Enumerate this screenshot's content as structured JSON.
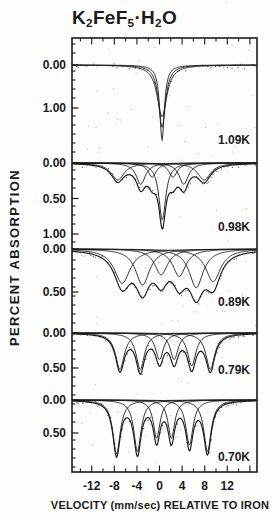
{
  "title": {
    "parts": [
      "K",
      "2",
      "FeF",
      "5",
      "·H",
      "2",
      "O"
    ]
  },
  "x_axis": {
    "label": "VELOCITY (mm/sec) RELATIVE TO IRON"
  },
  "y_axis": {
    "label": "PERCENT ABSORPTION"
  },
  "chart_data": {
    "type": "line",
    "x_unit": "mm/sec",
    "y_unit": "percent absorption",
    "x_major_ticks": [
      -12,
      -8,
      -4,
      0,
      4,
      8,
      12
    ],
    "x_major_tick_labels": [
      "-12",
      "-8",
      "-4",
      "0",
      "4",
      "8",
      "12"
    ],
    "x_minor_tick_step": 2,
    "panels": [
      {
        "temperature": "1.09K",
        "y_ticks": [
          {
            "label": "0.00",
            "value": 0.0
          },
          {
            "label": "1.00",
            "value": 1.0
          }
        ],
        "draw_sum": false,
        "components": [
          {
            "center": 0.45,
            "depth": 1.74,
            "width": 0.5
          },
          {
            "center": 0.45,
            "depth": 1.45,
            "width": 0.75
          },
          {
            "center": 0.45,
            "depth": 1.2,
            "width": 1.05
          }
        ],
        "baseline_px": 65,
        "px_per_percent": 43,
        "label_y_px": 140
      },
      {
        "temperature": "0.98K",
        "y_ticks": [
          {
            "label": "0.00",
            "value": 0.0
          },
          {
            "label": "0.50",
            "value": 0.5
          },
          {
            "label": "1.00",
            "value": 1.0
          }
        ],
        "draw_sum": true,
        "components": [
          {
            "center": -7.4,
            "depth": 0.24,
            "width": 1.4
          },
          {
            "center": -3.3,
            "depth": 0.3,
            "width": 1.0
          },
          {
            "center": -1.3,
            "depth": 0.2,
            "width": 0.9
          },
          {
            "center": 0.5,
            "depth": 0.8,
            "width": 0.75
          },
          {
            "center": 2.4,
            "depth": 0.2,
            "width": 0.9
          },
          {
            "center": 4.3,
            "depth": 0.3,
            "width": 1.0
          },
          {
            "center": 7.9,
            "depth": 0.24,
            "width": 1.4
          }
        ],
        "baseline_px": 163,
        "px_per_percent": 71,
        "label_y_px": 227
      },
      {
        "temperature": "0.89K",
        "y_ticks": [
          {
            "label": "0.00",
            "value": 0.0
          },
          {
            "label": "0.50",
            "value": 0.5
          }
        ],
        "draw_sum": true,
        "components": [
          {
            "center": -6.6,
            "depth": 0.4,
            "width": 1.7
          },
          {
            "center": -3.0,
            "depth": 0.42,
            "width": 1.5
          },
          {
            "center": 0.3,
            "depth": 0.3,
            "width": 1.4
          },
          {
            "center": 3.5,
            "depth": 0.32,
            "width": 1.4
          },
          {
            "center": 6.5,
            "depth": 0.45,
            "width": 1.5
          },
          {
            "center": 9.5,
            "depth": 0.38,
            "width": 1.6
          }
        ],
        "baseline_px": 249,
        "px_per_percent": 86,
        "label_y_px": 302
      },
      {
        "temperature": "0.79K",
        "y_ticks": [
          {
            "label": "0.00",
            "value": 0.0
          },
          {
            "label": "0.50",
            "value": 0.5
          }
        ],
        "draw_sum": true,
        "components": [
          {
            "center": -7.0,
            "depth": 0.52,
            "width": 0.95
          },
          {
            "center": -3.4,
            "depth": 0.52,
            "width": 0.9
          },
          {
            "center": 0.0,
            "depth": 0.38,
            "width": 0.85
          },
          {
            "center": 2.6,
            "depth": 0.38,
            "width": 0.85
          },
          {
            "center": 5.7,
            "depth": 0.47,
            "width": 0.9
          },
          {
            "center": 9.0,
            "depth": 0.52,
            "width": 0.95
          }
        ],
        "baseline_px": 333,
        "px_per_percent": 70,
        "label_y_px": 370
      },
      {
        "temperature": "0.70K",
        "y_ticks": [
          {
            "label": "0.00",
            "value": 0.0
          },
          {
            "label": "0.50",
            "value": 0.5
          }
        ],
        "draw_sum": true,
        "components": [
          {
            "center": -7.6,
            "depth": 0.82,
            "width": 0.8
          },
          {
            "center": -3.9,
            "depth": 0.78,
            "width": 0.78
          },
          {
            "center": -0.5,
            "depth": 0.58,
            "width": 0.72
          },
          {
            "center": 2.1,
            "depth": 0.58,
            "width": 0.72
          },
          {
            "center": 5.3,
            "depth": 0.68,
            "width": 0.78
          },
          {
            "center": 8.5,
            "depth": 0.78,
            "width": 0.8
          }
        ],
        "baseline_px": 400,
        "px_per_percent": 66,
        "label_y_px": 457
      }
    ],
    "layout": {
      "box": {
        "left": 72,
        "top": 38,
        "right": 257,
        "bottom": 472
      },
      "x0_px": 159.5,
      "px_per_mms": 5.65,
      "ink_color": "#1b1b1b",
      "dot_color": "#333333",
      "noise": {
        "seed": 421,
        "sigma_px": 1.7,
        "step_px": 2.1,
        "drop": 0.35,
        "specks": 95,
        "margin_specks": 14
      }
    }
  }
}
